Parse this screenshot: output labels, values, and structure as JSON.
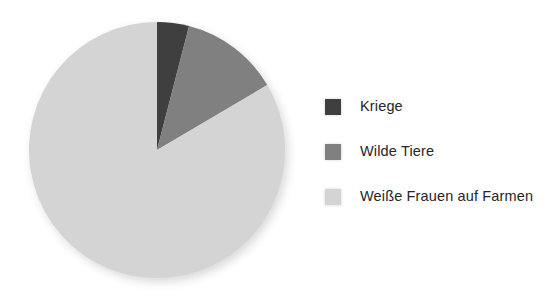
{
  "chart_data": {
    "type": "pie",
    "title": "",
    "subtitle": "",
    "xlabel": "",
    "ylabel": "",
    "grid": false,
    "legend_position": "right",
    "start_angle_deg": 0,
    "direction": "clockwise",
    "categories": [
      "Kriege",
      "Wilde Tiere",
      "Weiße Frauen auf Farmen"
    ],
    "values": [
      4,
      12.5,
      83.5
    ],
    "units": "percent",
    "slices": [
      {
        "label": "Kriege",
        "value": 4,
        "angle_deg": 14.5,
        "color": "#3f3f3f"
      },
      {
        "label": "Wilde Tiere",
        "value": 12.5,
        "angle_deg": 45,
        "color": "#808080"
      },
      {
        "label": "Weiße Frauen auf Farmen",
        "value": 83.5,
        "angle_deg": 300.5,
        "color": "#d4d4d4"
      }
    ],
    "colors": [
      "#3f3f3f",
      "#808080",
      "#d4d4d4"
    ]
  },
  "legend": {
    "items": [
      {
        "label": "Kriege",
        "color": "#3f3f3f"
      },
      {
        "label": "Wilde Tiere",
        "color": "#808080"
      },
      {
        "label": "Weiße Frauen auf Farmen",
        "color": "#d4d4d4"
      }
    ]
  },
  "colors": {
    "background": "#ffffff",
    "text": "#262626",
    "slice_dark": "#3f3f3f",
    "slice_medium": "#808080",
    "slice_light": "#d4d4d4"
  }
}
